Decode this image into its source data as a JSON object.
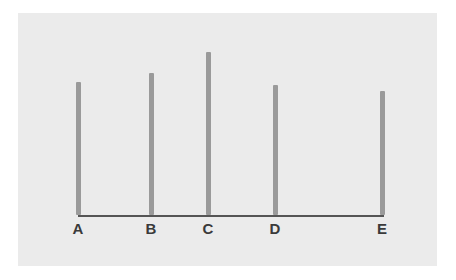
{
  "chart_data": {
    "type": "bar",
    "title": "",
    "subtitle": "",
    "xlabel": "",
    "ylabel": "",
    "categories": [
      "A",
      "B",
      "C",
      "D",
      "E"
    ],
    "values": [
      133,
      142,
      163,
      130,
      124
    ],
    "ylim": [
      0,
      180
    ],
    "grid": false,
    "legend": null,
    "annotations": [],
    "style": {
      "bar_color": "#9a9a9a",
      "axis_color": "#555555",
      "panel_background": "#ebebeb",
      "figure_background": "#ffffff",
      "label_color": "#3a3a3a",
      "bar_width_px": 5
    },
    "geometry": {
      "axis_y_px": 202,
      "axis_left_px": 60,
      "axis_right_px": 366,
      "label_y_px": 208,
      "bar_x_px": [
        60,
        133,
        190,
        257,
        364
      ]
    }
  }
}
